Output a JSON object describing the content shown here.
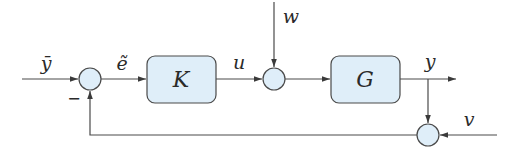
{
  "diagram": {
    "type": "feedback control block diagram",
    "colors": {
      "block_fill": "#dfeef9",
      "stroke": "#4a4a4a",
      "text": "#2a2a2a",
      "background": "#ffffff"
    },
    "blocks": [
      {
        "id": "K",
        "label": "K",
        "role": "controller"
      },
      {
        "id": "G",
        "label": "G",
        "role": "plant"
      }
    ],
    "summing_junctions": [
      {
        "id": "sum1",
        "inputs": [
          "ȳ (+)",
          "feedback (−)"
        ],
        "sign_label": "−"
      },
      {
        "id": "sum2",
        "inputs": [
          "u",
          "w"
        ]
      },
      {
        "id": "sum3",
        "inputs": [
          "y",
          "v"
        ]
      }
    ],
    "signals": {
      "reference": "ȳ",
      "error": "ẽ",
      "control": "u",
      "disturbance": "w",
      "output": "y",
      "noise": "v"
    },
    "edges": [
      [
        "ȳ",
        "sum1"
      ],
      [
        "sum1",
        "K"
      ],
      [
        "K",
        "sum2"
      ],
      [
        "w",
        "sum2"
      ],
      [
        "sum2",
        "G"
      ],
      [
        "G",
        "y"
      ],
      [
        "y",
        "sum3"
      ],
      [
        "v",
        "sum3"
      ],
      [
        "sum3",
        "sum1"
      ]
    ]
  }
}
